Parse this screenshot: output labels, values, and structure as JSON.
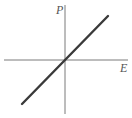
{
  "chart_data": {
    "type": "line",
    "title": "",
    "xlabel": "E",
    "ylabel": "P",
    "series": [
      {
        "name": "P(E)",
        "x": [
          -1,
          0,
          1
        ],
        "y": [
          -1,
          0,
          1
        ]
      }
    ],
    "xlim": [
      -1,
      1
    ],
    "ylim": [
      -1,
      1
    ],
    "grid": false,
    "legend": "none"
  },
  "colors": {
    "axis": "#7a7a7a",
    "line": "#3a3a3a",
    "label": "#555555"
  }
}
